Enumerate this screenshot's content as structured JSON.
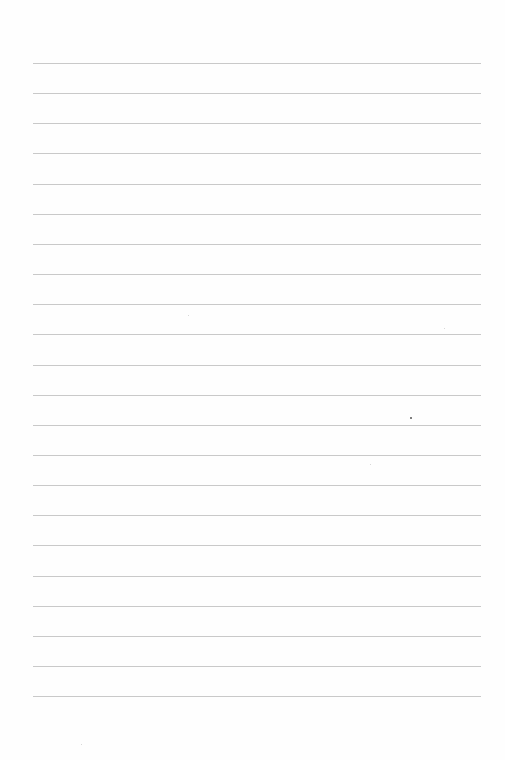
{
  "page": {
    "type": "lined-paper",
    "background_color": "#fefefe",
    "rule_color": "#c9c9c9",
    "rule_count": 22,
    "first_rule_y": 63,
    "rule_spacing": 30.15,
    "rule_left": 33,
    "rule_right": 481,
    "text": ""
  }
}
